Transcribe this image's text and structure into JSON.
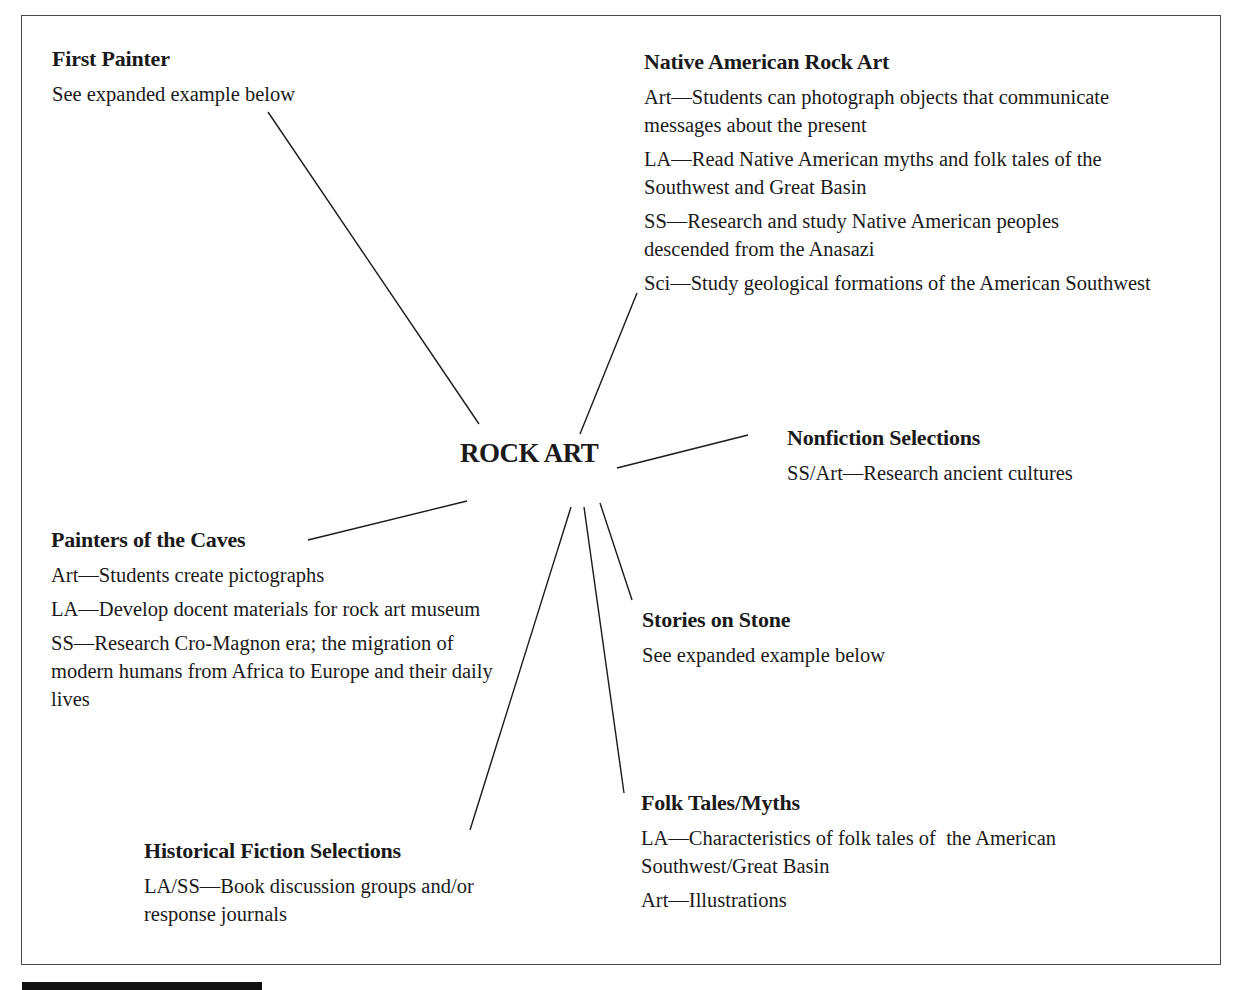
{
  "diagram": {
    "center": {
      "label": "ROCK ART"
    },
    "nodes": {
      "first_painter": {
        "title": "First Painter",
        "items": [
          "See expanded example below"
        ]
      },
      "native_american_rock_art": {
        "title": "Native American Rock Art",
        "items": [
          "Art—Students can photograph objects that communicate messages about the present",
          "LA—Read Native American myths and folk tales of the Southwest and Great Basin",
          "SS—Research and study Native American peoples descended from the Anasazi",
          "Sci—Study geological formations of the American Southwest"
        ]
      },
      "nonfiction_selections": {
        "title": "Nonfiction Selections",
        "items": [
          "SS/Art—Research ancient cultures"
        ]
      },
      "painters_of_the_caves": {
        "title": "Painters of the Caves",
        "items": [
          "Art—Students create pictographs",
          "LA—Develop docent materials for rock art museum",
          "SS—Research Cro-Magnon era; the migration of modern humans from Africa to Europe and their daily lives"
        ]
      },
      "stories_on_stone": {
        "title": "Stories on Stone",
        "items": [
          "See expanded example below"
        ]
      },
      "folk_tales_myths": {
        "title": "Folk Tales/Myths",
        "items": [
          "LA—Characteristics of folk tales of  the American Southwest/Great Basin",
          "Art—Illustrations"
        ]
      },
      "historical_fiction_selections": {
        "title": "Historical Fiction Selections",
        "items": [
          "LA/SS—Book discussion groups and/or response journals"
        ]
      }
    },
    "connectors": [
      {
        "to": "first_painter",
        "x1": 268,
        "y1": 112,
        "x2": 479,
        "y2": 424
      },
      {
        "to": "native_american_rock_art",
        "x1": 637,
        "y1": 293,
        "x2": 580,
        "y2": 434
      },
      {
        "to": "nonfiction_selections",
        "x1": 748,
        "y1": 435,
        "x2": 617,
        "y2": 468
      },
      {
        "to": "painters_of_the_caves",
        "x1": 308,
        "y1": 540,
        "x2": 467,
        "y2": 501
      },
      {
        "to": "stories_on_stone",
        "x1": 600,
        "y1": 503,
        "x2": 632,
        "y2": 600
      },
      {
        "to": "folk_tales_myths",
        "x1": 584,
        "y1": 507,
        "x2": 624,
        "y2": 793
      },
      {
        "to": "historical_fiction_selections",
        "x1": 571,
        "y1": 507,
        "x2": 470,
        "y2": 830
      }
    ]
  }
}
